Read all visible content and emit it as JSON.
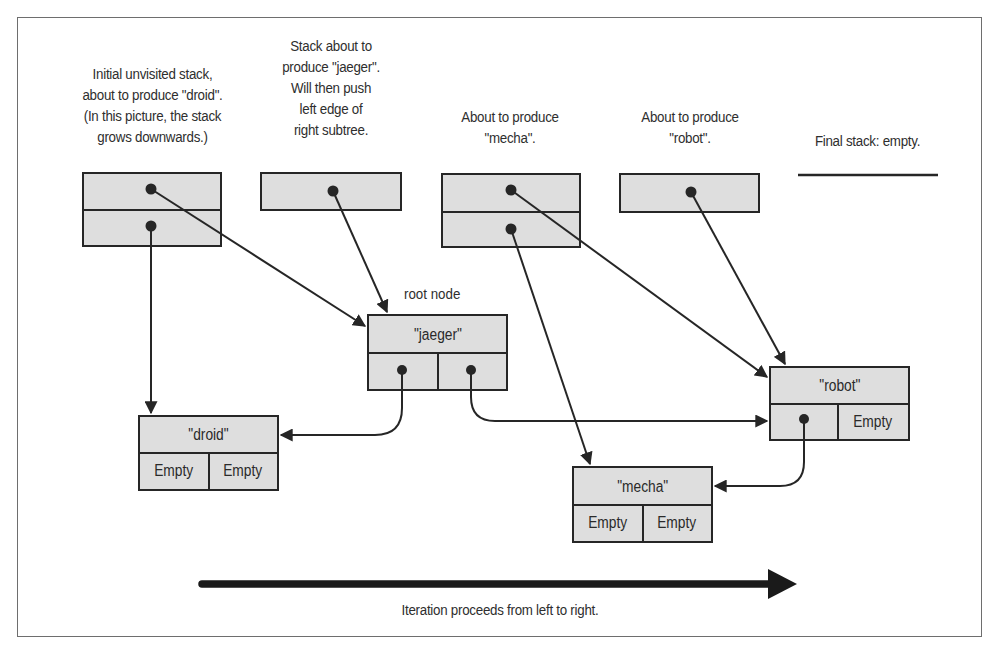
{
  "captions": {
    "stack1": [
      "Initial unvisited stack,",
      "about to produce \"droid\".",
      "(In this picture, the stack",
      "grows downwards.)"
    ],
    "stack2": [
      "Stack about to",
      "produce \"jaeger\".",
      "Will then push",
      "left edge of",
      "right subtree."
    ],
    "stack3": [
      "About to produce",
      "\"mecha\"."
    ],
    "stack4": [
      "About to produce",
      "\"robot\"."
    ],
    "stack5": [
      "Final stack: empty."
    ]
  },
  "root_label": "root node",
  "nodes": {
    "jaeger": {
      "value": "\"jaeger\"",
      "left": "",
      "right": ""
    },
    "droid": {
      "value": "\"droid\"",
      "left": "Empty",
      "right": "Empty"
    },
    "mecha": {
      "value": "\"mecha\"",
      "left": "Empty",
      "right": "Empty"
    },
    "robot": {
      "value": "\"robot\"",
      "left": "",
      "right": "Empty"
    }
  },
  "footer": {
    "caption": "Iteration proceeds from left to right."
  },
  "colors": {
    "cell_fill": "#dedede",
    "stroke": "#262626",
    "frame": "#6e6e6e"
  }
}
